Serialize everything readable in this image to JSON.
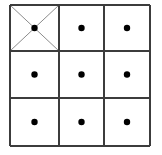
{
  "figure": {
    "background_color": "#ffffff",
    "border_color": "#3c3c3c",
    "diagonal_color": "#8c8c8c",
    "dot_color": "#000000",
    "border_width": 2,
    "diagonal_width": 1,
    "dot_radius": 3.2
  },
  "grid": {
    "rows": 3,
    "columns": 3,
    "left": 10,
    "top": 5,
    "right": 150,
    "bottom": 146,
    "column_edges": [
      10,
      59,
      104,
      150
    ],
    "row_edges": [
      5,
      51,
      98,
      146
    ],
    "cells": [
      {
        "id": "cell-r1-c1",
        "row": 1,
        "column": 1,
        "has_dot": true,
        "marked_with_x": true,
        "center_x": 34.5,
        "center_y": 28.0
      },
      {
        "id": "cell-r1-c2",
        "row": 1,
        "column": 2,
        "has_dot": true,
        "marked_with_x": false,
        "center_x": 81.5,
        "center_y": 28.0
      },
      {
        "id": "cell-r1-c3",
        "row": 1,
        "column": 3,
        "has_dot": true,
        "marked_with_x": false,
        "center_x": 127.0,
        "center_y": 28.0
      },
      {
        "id": "cell-r2-c1",
        "row": 2,
        "column": 1,
        "has_dot": true,
        "marked_with_x": false,
        "center_x": 34.5,
        "center_y": 74.5
      },
      {
        "id": "cell-r2-c2",
        "row": 2,
        "column": 2,
        "has_dot": true,
        "marked_with_x": false,
        "center_x": 81.5,
        "center_y": 74.5
      },
      {
        "id": "cell-r2-c3",
        "row": 2,
        "column": 3,
        "has_dot": true,
        "marked_with_x": false,
        "center_x": 127.0,
        "center_y": 74.5
      },
      {
        "id": "cell-r3-c1",
        "row": 3,
        "column": 1,
        "has_dot": true,
        "marked_with_x": false,
        "center_x": 34.5,
        "center_y": 122.0
      },
      {
        "id": "cell-r3-c2",
        "row": 3,
        "column": 2,
        "has_dot": true,
        "marked_with_x": false,
        "center_x": 81.5,
        "center_y": 122.0
      },
      {
        "id": "cell-r3-c3",
        "row": 3,
        "column": 3,
        "has_dot": true,
        "marked_with_x": false,
        "center_x": 127.0,
        "center_y": 122.0
      }
    ]
  }
}
